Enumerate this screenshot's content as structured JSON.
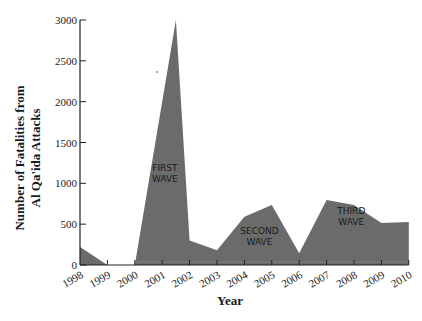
{
  "chart_data": {
    "type": "area",
    "title": "",
    "xlabel": "Year",
    "ylabel_lines": [
      "Number of Fatalities from",
      "Al Qa'ida Attacks"
    ],
    "ylabel": "Number of Fatalities from Al Qa'ida Attacks",
    "ylim": [
      0,
      3000
    ],
    "yticks": [
      0,
      500,
      1000,
      1500,
      2000,
      2500,
      3000
    ],
    "categories": [
      "1998",
      "1999",
      "2000",
      "2001",
      "2002",
      "2003",
      "2004",
      "2005",
      "2006",
      "2007",
      "2008",
      "2009",
      "2010"
    ],
    "points": [
      {
        "x": 1998.0,
        "y": 220
      },
      {
        "x": 1999.0,
        "y": 0
      },
      {
        "x": 2000.0,
        "y": 0
      },
      {
        "x": 2001.5,
        "y": 3000
      },
      {
        "x": 2002.0,
        "y": 300
      },
      {
        "x": 2003.0,
        "y": 180
      },
      {
        "x": 2004.0,
        "y": 590
      },
      {
        "x": 2005.0,
        "y": 735
      },
      {
        "x": 2006.0,
        "y": 145
      },
      {
        "x": 2007.0,
        "y": 795
      },
      {
        "x": 2008.0,
        "y": 735
      },
      {
        "x": 2009.0,
        "y": 515
      },
      {
        "x": 2010.0,
        "y": 525
      }
    ],
    "annotations": [
      {
        "lines": [
          "FIRST",
          "WAVE"
        ],
        "x": 2001.1,
        "y": 1150
      },
      {
        "lines": [
          "SECOND",
          "WAVE"
        ],
        "x": 2004.55,
        "y": 380
      },
      {
        "lines": [
          "THIRD",
          "WAVE"
        ],
        "x": 2007.9,
        "y": 620
      }
    ],
    "grid": false,
    "legend": null,
    "fill_color": "#6b6b6b",
    "axis_color": "#222222"
  }
}
